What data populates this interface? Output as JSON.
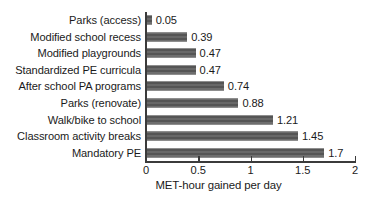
{
  "chart_data": {
    "type": "bar",
    "orientation": "horizontal",
    "title": "",
    "xlabel": "MET-hour gained per day",
    "ylabel": "",
    "xlim": [
      0,
      2
    ],
    "xticks": [
      0,
      0.5,
      1,
      1.5,
      2
    ],
    "xticklabels": [
      "0",
      "0.5",
      "1",
      "1.5",
      "2"
    ],
    "grid": false,
    "legend": false,
    "bar_color": "#5e5e5e",
    "axis_color": "#3b3b3b",
    "text_color": "#1a1a1a",
    "categories": [
      "Parks (access)",
      "Modified school recess",
      "Modified playgrounds",
      "Standardized PE curricula",
      "After school PA programs",
      "Parks (renovate)",
      "Walk/bike to school",
      "Classroom activity breaks",
      "Mandatory PE"
    ],
    "values": [
      0.05,
      0.39,
      0.47,
      0.47,
      0.74,
      0.88,
      1.21,
      1.45,
      1.7
    ],
    "value_labels": [
      "0.05",
      "0.39",
      "0.47",
      "0.47",
      "0.74",
      "0.88",
      "1.21",
      "1.45",
      "1.7"
    ]
  }
}
